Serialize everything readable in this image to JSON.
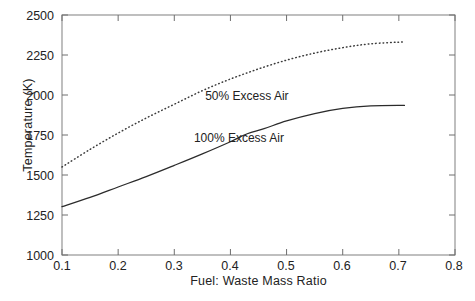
{
  "chart_data": {
    "type": "line",
    "title": "",
    "xlabel": "Fuel: Waste Mass Ratio",
    "ylabel": "Temperature (K)",
    "xlim": [
      0.1,
      0.8
    ],
    "ylim": [
      1000,
      2500
    ],
    "xticks": [
      "0.1",
      "0.2",
      "0.3",
      "0.4",
      "0.5",
      "0.6",
      "0.7",
      "0.8"
    ],
    "yticks": [
      "1000",
      "1250",
      "1500",
      "1750",
      "2000",
      "2250",
      "2500"
    ],
    "grid": false,
    "legend_position": "inline-annotations",
    "series": [
      {
        "name": "50% Excess Air",
        "style": "dotted",
        "color": "#3a3a3a",
        "label_x": 0.355,
        "label_y": 1985,
        "x": [
          0.1,
          0.15,
          0.2,
          0.25,
          0.3,
          0.35,
          0.4,
          0.45,
          0.5,
          0.55,
          0.6,
          0.65,
          0.71
        ],
        "y": [
          1550,
          1660,
          1762,
          1856,
          1942,
          2027,
          2100,
          2163,
          2218,
          2262,
          2296,
          2320,
          2332
        ]
      },
      {
        "name": "100% Excess Air",
        "style": "solid",
        "color": "#2b2b2b",
        "label_x": 0.335,
        "label_y": 1723,
        "x": [
          0.1,
          0.15,
          0.2,
          0.25,
          0.3,
          0.35,
          0.4,
          0.43,
          0.46,
          0.5,
          0.55,
          0.6,
          0.65,
          0.71
        ],
        "y": [
          1302,
          1360,
          1425,
          1490,
          1560,
          1632,
          1708,
          1758,
          1790,
          1838,
          1884,
          1916,
          1932,
          1935
        ]
      }
    ]
  },
  "axes": {
    "y_title": "Temperature (K)",
    "x_title": "Fuel: Waste Mass Ratio",
    "y_tick_labels": [
      "2500",
      "2250",
      "2000",
      "1750",
      "1500",
      "1250",
      "1000"
    ],
    "x_tick_labels": [
      "0.1",
      "0.2",
      "0.3",
      "0.4",
      "0.5",
      "0.6",
      "0.7",
      "0.8"
    ]
  },
  "annotations": {
    "upper_curve_label": "50% Excess Air",
    "lower_curve_label": "100% Excess Air"
  },
  "colors": {
    "frame": "#8a8a8a",
    "tick": "#6e6e6e",
    "solid_curve": "#2b2b2b",
    "dotted_curve": "#3a3a3a",
    "text": "#222222",
    "background": "#ffffff"
  }
}
